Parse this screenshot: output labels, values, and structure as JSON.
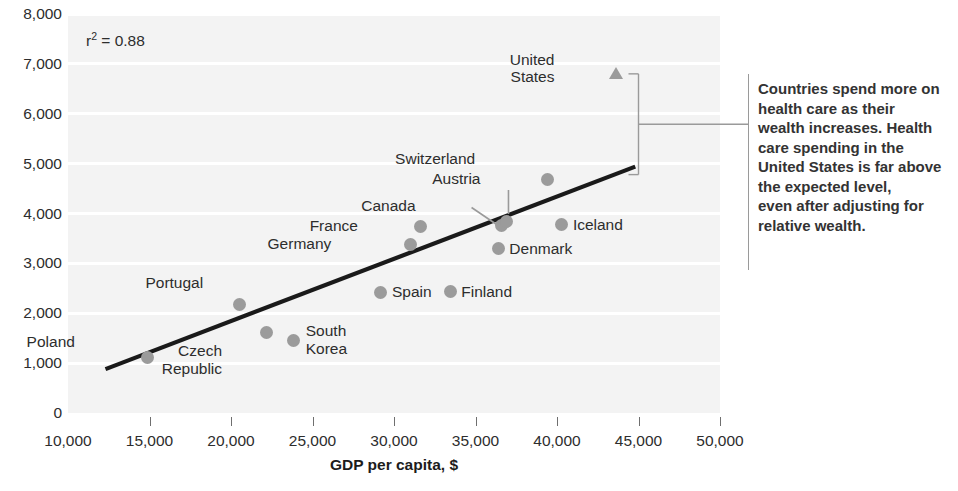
{
  "chart_data": {
    "type": "scatter",
    "title": "",
    "xlabel": "GDP per capita, $",
    "ylabel": "",
    "xlim": [
      10000,
      50000
    ],
    "ylim": [
      0,
      8000
    ],
    "grid": true,
    "legend": "none",
    "annotations": {
      "r_squared_label": "r",
      "r_squared_exponent": "2",
      "r_squared_value": "= 0.88",
      "callout_text": "Countries spend more on\nhealth care as their\nwealth increases. Health\ncare spending in the\nUnited States is far above\nthe expected level,\neven after adjusting for\nrelative wealth."
    },
    "x_ticks": [
      "10,000",
      "15,000",
      "20,000",
      "25,000",
      "30,000",
      "35,000",
      "40,000",
      "45,000",
      "50,000"
    ],
    "x_tick_values": [
      10000,
      15000,
      20000,
      25000,
      30000,
      35000,
      40000,
      45000,
      50000
    ],
    "y_ticks": [
      "0",
      "1,000",
      "2,000",
      "3,000",
      "4,000",
      "5,000",
      "6,000",
      "7,000",
      "8,000"
    ],
    "y_tick_values": [
      0,
      1000,
      2000,
      3000,
      4000,
      5000,
      6000,
      7000,
      8000
    ],
    "points": [
      {
        "name": "Poland",
        "x": 14900,
        "y": 1120,
        "marker": "circle",
        "label": "Poland",
        "label_dx": -73,
        "label_dy": -24,
        "label_align": "left"
      },
      {
        "name": "Portugal",
        "x": 20500,
        "y": 2180,
        "marker": "circle",
        "label": "Portugal",
        "label_dx": -36,
        "label_dy": -30,
        "label_align": "left"
      },
      {
        "name": "Czech Republic",
        "x": 22150,
        "y": 1620,
        "marker": "circle",
        "label": "Czech\nRepublic",
        "label_dx": -44,
        "label_dy": 10,
        "label_align": "left"
      },
      {
        "name": "South Korea",
        "x": 23850,
        "y": 1460,
        "marker": "circle",
        "label": "South\nKorea",
        "label_dx": 12,
        "label_dy": -18,
        "label_align": "left"
      },
      {
        "name": "Spain",
        "x": 29200,
        "y": 2420,
        "marker": "circle",
        "label": "Spain",
        "label_dx": 11,
        "label_dy": -9,
        "label_align": "left"
      },
      {
        "name": "Germany",
        "x": 31000,
        "y": 3380,
        "marker": "circle",
        "label": "Germany",
        "label_dx": -79,
        "label_dy": -9,
        "label_align": "left"
      },
      {
        "name": "France",
        "x": 31650,
        "y": 3740,
        "marker": "circle",
        "label": "France",
        "label_dx": -63,
        "label_dy": -9,
        "label_align": "left"
      },
      {
        "name": "Finland",
        "x": 33450,
        "y": 2430,
        "marker": "circle",
        "label": "Finland",
        "label_dx": 11,
        "label_dy": -9,
        "label_align": "left"
      },
      {
        "name": "Denmark",
        "x": 36400,
        "y": 3290,
        "marker": "circle",
        "label": "Denmark",
        "label_dx": 11,
        "label_dy": -9,
        "label_align": "left"
      },
      {
        "name": "Canada",
        "x": 36600,
        "y": 3760,
        "marker": "circle",
        "label": "Canada",
        "label_dx": -86,
        "label_dy": -28,
        "label_align": "left"
      },
      {
        "name": "Austria",
        "x": 36900,
        "y": 3830,
        "marker": "circle",
        "label": "Austria",
        "label_dx": -26,
        "label_dy": -52,
        "label_align": "left"
      },
      {
        "name": "Switzerland",
        "x": 39400,
        "y": 4680,
        "marker": "circle",
        "label": "Switzerland",
        "label_dx": -72,
        "label_dy": -30,
        "label_align": "left"
      },
      {
        "name": "Iceland",
        "x": 40300,
        "y": 3770,
        "marker": "circle",
        "label": "Iceland",
        "label_dx": 11,
        "label_dy": -9,
        "label_align": "left"
      },
      {
        "name": "United States",
        "x": 43650,
        "y": 6820,
        "marker": "triangle",
        "label": "United\nStates",
        "label_dx": -62,
        "label_dy": -22,
        "label_align": "left"
      }
    ],
    "trendline": {
      "label": "fit-line",
      "x_start": 12300,
      "y_start": 880,
      "x_end": 44800,
      "y_end": 4940
    },
    "bracket": {
      "x": 45000,
      "y_top": 6800,
      "y_bottom": 4780
    }
  },
  "colors": {
    "plot_background": "#f3f3f3",
    "gridline": "#ffffff",
    "marker": "#9b9b9b",
    "trendline": "#1a1a1a",
    "text": "#2d2d2d",
    "annotation_text": "#333333",
    "rule": "#9a9a9a"
  }
}
